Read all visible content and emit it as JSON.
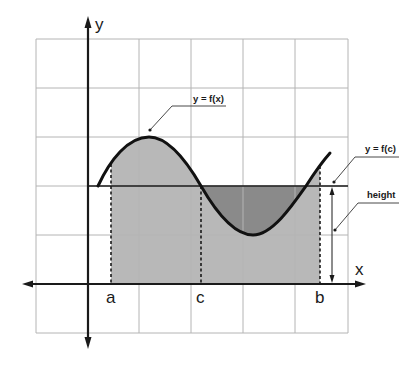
{
  "diagram": {
    "axes": {
      "x_label": "x",
      "y_label": "y"
    },
    "points": {
      "a_label": "a",
      "c_label": "c",
      "b_label": "b"
    },
    "callouts": {
      "curve_label": "y = f(x)",
      "mean_line_label": "y = f(c)",
      "height_label": "height"
    },
    "colors": {
      "grid": "#b4b4b4",
      "axis": "#1a1a1a",
      "curve": "#111111",
      "rectangle_fill": "#b8b8b8",
      "dark_region_fill": "#8a8a8a",
      "background": "#ffffff"
    },
    "grid": {
      "columns": 6,
      "rows": 6
    }
  }
}
